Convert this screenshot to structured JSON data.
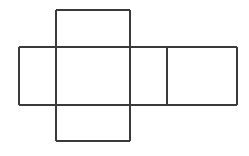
{
  "figure": {
    "name": "cube-net",
    "background_color": "#ffffff",
    "line_color": "#3a3a3a",
    "line_width": 1.6,
    "canvas": {
      "width": 249,
      "height": 156
    }
  },
  "geometry": {
    "columns_x": [
      19,
      56,
      130,
      167,
      237
    ],
    "rows_y": [
      10,
      47,
      105,
      141
    ],
    "faces": [
      {
        "id": "top-face",
        "label": "top",
        "x": 56,
        "y": 10,
        "w": 74,
        "h": 37
      },
      {
        "id": "left-face",
        "label": "left",
        "x": 19,
        "y": 47,
        "w": 37,
        "h": 58
      },
      {
        "id": "middle-face",
        "label": "middle",
        "x": 56,
        "y": 47,
        "w": 74,
        "h": 58
      },
      {
        "id": "inner-right-face",
        "label": "inner-right",
        "x": 130,
        "y": 47,
        "w": 37,
        "h": 58
      },
      {
        "id": "right-face",
        "label": "right",
        "x": 167,
        "y": 47,
        "w": 70,
        "h": 58
      },
      {
        "id": "bottom-face",
        "label": "bottom",
        "x": 56,
        "y": 105,
        "w": 74,
        "h": 36
      }
    ],
    "edges": [
      {
        "id": "top-face-top-edge",
        "x1": 56,
        "y1": 10,
        "x2": 130,
        "y2": 10
      },
      {
        "id": "top-face-left-edge",
        "x1": 56,
        "y1": 10,
        "x2": 56,
        "y2": 47
      },
      {
        "id": "top-face-right-edge",
        "x1": 130,
        "y1": 10,
        "x2": 130,
        "y2": 47
      },
      {
        "id": "band-top-edge",
        "x1": 19,
        "y1": 47,
        "x2": 237,
        "y2": 47
      },
      {
        "id": "band-bottom-edge",
        "x1": 19,
        "y1": 105,
        "x2": 237,
        "y2": 105
      },
      {
        "id": "left-face-left-edge",
        "x1": 19,
        "y1": 47,
        "x2": 19,
        "y2": 105
      },
      {
        "id": "left-middle-divider",
        "x1": 56,
        "y1": 47,
        "x2": 56,
        "y2": 105
      },
      {
        "id": "middle-inner-divider",
        "x1": 130,
        "y1": 47,
        "x2": 130,
        "y2": 105
      },
      {
        "id": "inner-right-divider",
        "x1": 167,
        "y1": 47,
        "x2": 167,
        "y2": 105
      },
      {
        "id": "right-face-right-edge",
        "x1": 237,
        "y1": 47,
        "x2": 237,
        "y2": 105
      },
      {
        "id": "bottom-face-left-edge",
        "x1": 56,
        "y1": 105,
        "x2": 56,
        "y2": 141
      },
      {
        "id": "bottom-face-right-edge",
        "x1": 130,
        "y1": 105,
        "x2": 130,
        "y2": 141
      },
      {
        "id": "bottom-face-bottom-edge",
        "x1": 56,
        "y1": 141,
        "x2": 130,
        "y2": 141
      }
    ]
  },
  "labels": {
    "visible_text": []
  }
}
